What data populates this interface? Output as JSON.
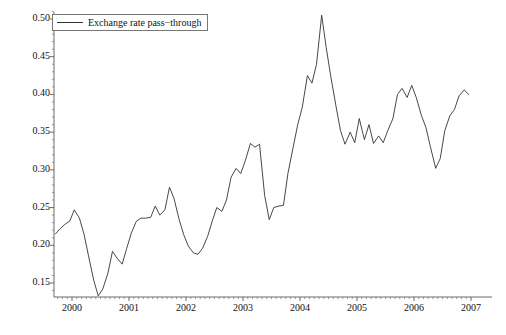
{
  "chart_data": {
    "type": "line",
    "title": "",
    "xlabel": "",
    "ylabel": "",
    "xlim": [
      1999.62,
      2007.05
    ],
    "ylim": [
      0.128,
      0.515
    ],
    "grid": false,
    "legend": {
      "position": "top-left",
      "entries": [
        {
          "name": "Exchange rate pass-through",
          "label": "Exchange rate pass−through",
          "color": "#333333"
        }
      ]
    },
    "y_ticks": [
      0.15,
      0.2,
      0.25,
      0.3,
      0.35,
      0.4,
      0.45,
      0.5
    ],
    "y_tick_labels": [
      "0.15",
      "0.20",
      "0.25",
      "0.30",
      "0.35",
      "0.40",
      "0.45",
      "0.50"
    ],
    "x_ticks": [
      2000,
      2001,
      2002,
      2003,
      2004,
      2005,
      2006,
      2007
    ],
    "x_tick_labels": [
      "2000",
      "2001",
      "2002",
      "2003",
      "2004",
      "2005",
      "2006",
      "2007"
    ],
    "x_minor_tick_step": 0.0833,
    "y_minor_tick_step": 0.01,
    "series": [
      {
        "name": "Exchange rate pass-through",
        "color": "#333333",
        "x": [
          1999.708,
          1999.792,
          1999.875,
          1999.958,
          2000.042,
          2000.125,
          2000.208,
          2000.292,
          2000.375,
          2000.458,
          2000.542,
          2000.625,
          2000.708,
          2000.792,
          2000.875,
          2000.958,
          2001.042,
          2001.125,
          2001.208,
          2001.292,
          2001.375,
          2001.458,
          2001.542,
          2001.625,
          2001.708,
          2001.792,
          2001.875,
          2001.958,
          2002.042,
          2002.125,
          2002.208,
          2002.292,
          2002.375,
          2002.458,
          2002.542,
          2002.625,
          2002.708,
          2002.792,
          2002.875,
          2002.958,
          2003.042,
          2003.125,
          2003.208,
          2003.292,
          2003.375,
          2003.458,
          2003.542,
          2003.625,
          2003.708,
          2003.792,
          2003.875,
          2003.958,
          2004.042,
          2004.125,
          2004.208,
          2004.292,
          2004.375,
          2004.458,
          2004.542,
          2004.625,
          2004.708,
          2004.792,
          2004.875,
          2004.958,
          2005.042,
          2005.125,
          2005.208,
          2005.292,
          2005.375,
          2005.458,
          2005.542,
          2005.625,
          2005.708,
          2005.792,
          2005.875,
          2005.958,
          2006.042,
          2006.125,
          2006.208,
          2006.292,
          2006.375,
          2006.458,
          2006.542,
          2006.625,
          2006.708,
          2006.792,
          2006.875,
          2006.958
        ],
        "y": [
          0.215,
          0.222,
          0.228,
          0.232,
          0.247,
          0.236,
          0.215,
          0.186,
          0.154,
          0.133,
          0.142,
          0.163,
          0.192,
          0.183,
          0.175,
          0.196,
          0.216,
          0.232,
          0.236,
          0.236,
          0.237,
          0.252,
          0.24,
          0.247,
          0.277,
          0.262,
          0.234,
          0.214,
          0.199,
          0.19,
          0.188,
          0.196,
          0.212,
          0.232,
          0.25,
          0.245,
          0.26,
          0.29,
          0.302,
          0.295,
          0.312,
          0.335,
          0.33,
          0.334,
          0.266,
          0.234,
          0.25,
          0.252,
          0.253,
          0.296,
          0.33,
          0.36,
          0.383,
          0.425,
          0.415,
          0.44,
          0.505,
          0.462,
          0.424,
          0.385,
          0.352,
          0.334,
          0.35,
          0.336,
          0.368,
          0.34,
          0.36,
          0.335,
          0.345,
          0.336,
          0.352,
          0.368,
          0.4,
          0.408,
          0.396,
          0.412,
          0.396,
          0.372,
          0.356,
          0.33,
          0.302,
          0.315,
          0.352,
          0.372,
          0.38,
          0.398,
          0.406,
          0.4
        ],
        "note": "monthly series, Aug 1999 - Dec 2006"
      },
      {
        "name": "Exchange rate pass-through (continued)",
        "color": "#333333",
        "x": [],
        "y": []
      }
    ],
    "series_full": {
      "name": "Exchange rate pass-through",
      "x": [
        1999.71,
        1999.79,
        1999.88,
        1999.96,
        2000.04,
        2000.13,
        2000.21,
        2000.29,
        2000.38,
        2000.46,
        2000.54,
        2000.63,
        2000.71,
        2000.79,
        2000.88,
        2000.96,
        2001.04,
        2001.13,
        2001.21,
        2001.29,
        2001.38,
        2001.46,
        2001.54,
        2001.63,
        2001.71,
        2001.79,
        2001.88,
        2001.96,
        2002.04,
        2002.13,
        2002.21,
        2002.29,
        2002.38,
        2002.46,
        2002.54,
        2002.63,
        2002.71,
        2002.79,
        2002.88,
        2002.96,
        2003.04,
        2003.13,
        2003.21,
        2003.29,
        2003.38,
        2003.46,
        2003.54,
        2003.63,
        2003.71,
        2003.79,
        2003.88,
        2003.96,
        2004.04,
        2004.13,
        2004.21,
        2004.29,
        2004.38,
        2004.46,
        2004.54,
        2004.63,
        2004.71,
        2004.79,
        2004.88,
        2004.96,
        2005.04,
        2005.13,
        2005.21,
        2005.29,
        2005.38,
        2005.46,
        2005.54,
        2005.63,
        2005.71,
        2005.79,
        2005.88,
        2005.96,
        2006.04,
        2006.13,
        2006.21,
        2006.29,
        2006.38,
        2006.46,
        2006.54,
        2006.63,
        2006.71,
        2006.79,
        2006.88,
        2006.96
      ],
      "y": [
        0.215,
        0.222,
        0.228,
        0.232,
        0.247,
        0.236,
        0.215,
        0.186,
        0.154,
        0.133,
        0.142,
        0.163,
        0.192,
        0.183,
        0.175,
        0.196,
        0.216,
        0.232,
        0.236,
        0.236,
        0.237,
        0.252,
        0.24,
        0.247,
        0.277,
        0.262,
        0.234,
        0.214,
        0.199,
        0.19,
        0.188,
        0.196,
        0.212,
        0.232,
        0.25,
        0.245,
        0.26,
        0.29,
        0.302,
        0.295,
        0.312,
        0.335,
        0.33,
        0.334,
        0.266,
        0.234,
        0.25,
        0.252,
        0.253,
        0.296,
        0.33,
        0.36,
        0.383,
        0.425,
        0.415,
        0.44,
        0.505,
        0.462,
        0.424,
        0.385,
        0.352,
        0.334,
        0.35,
        0.336,
        0.368,
        0.34,
        0.36,
        0.335,
        0.345,
        0.336,
        0.352,
        0.368,
        0.4,
        0.408,
        0.396,
        0.412,
        0.396,
        0.372,
        0.356,
        0.33,
        0.302,
        0.315,
        0.352,
        0.372,
        0.38,
        0.398,
        0.406,
        0.4
      ]
    }
  }
}
